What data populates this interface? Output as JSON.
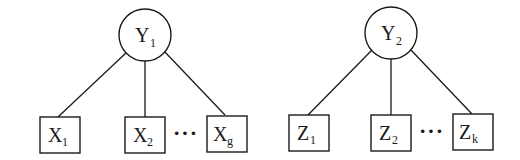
{
  "diagram": {
    "type": "factor-model-trees",
    "groups": [
      {
        "latent": {
          "base": "Y",
          "sub": "1"
        },
        "indicators": [
          {
            "base": "X",
            "sub": "1"
          },
          {
            "base": "X",
            "sub": "2"
          },
          {
            "base": "X",
            "sub": "g"
          }
        ],
        "ellipsis": "···"
      },
      {
        "latent": {
          "base": "Y",
          "sub": "2"
        },
        "indicators": [
          {
            "base": "Z",
            "sub": "1"
          },
          {
            "base": "Z",
            "sub": "2"
          },
          {
            "base": "Z",
            "sub": "k"
          }
        ],
        "ellipsis": "···"
      }
    ],
    "edges": [
      {
        "from": "Y1",
        "to": "X1"
      },
      {
        "from": "Y1",
        "to": "X2"
      },
      {
        "from": "Y1",
        "to": "Xg"
      },
      {
        "from": "Y2",
        "to": "Z1"
      },
      {
        "from": "Y2",
        "to": "Z2"
      },
      {
        "from": "Y2",
        "to": "Zk"
      }
    ]
  }
}
